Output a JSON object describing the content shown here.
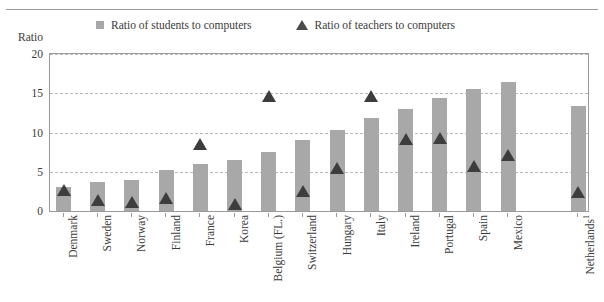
{
  "page": {
    "clipped_header_ghost": "",
    "axis_title": "Ratio"
  },
  "legend": {
    "items": [
      {
        "label": "Ratio of students to computers",
        "marker": "square-swatch",
        "color": "#a8a8a8"
      },
      {
        "label": "Ratio of teachers to computers",
        "marker": "triangle-swatch",
        "color": "#3d3d3d"
      }
    ]
  },
  "chart_data": {
    "type": "bar",
    "title": "",
    "xlabel": "",
    "ylabel": "Ratio",
    "ylim": [
      0,
      20
    ],
    "yticks": [
      0,
      5,
      10,
      15,
      20
    ],
    "grid": true,
    "legend_position": "top",
    "categories": [
      "Denmark",
      "Sweden",
      "Norway",
      "Finland",
      "France",
      "Korea",
      "Belgium (FL.)",
      "Switzerland",
      "Hungary",
      "Italy",
      "Ireland",
      "Portugal",
      "Spain",
      "Mexico",
      "Netherlands"
    ],
    "category_notes": {
      "Netherlands": "1"
    },
    "series": [
      {
        "name": "Ratio of students to computers",
        "type": "bar",
        "color": "#a8a8a8",
        "values": [
          3.1,
          3.7,
          3.9,
          5.2,
          6.0,
          6.5,
          7.5,
          9.1,
          10.3,
          11.8,
          13.0,
          14.4,
          15.5,
          16.4,
          13.4
        ]
      },
      {
        "name": "Ratio of teachers to computers",
        "type": "scatter",
        "marker": "triangle",
        "color": "#3d3d3d",
        "values": [
          2.7,
          1.4,
          1.2,
          1.7,
          8.5,
          0.9,
          14.7,
          2.5,
          5.5,
          14.6,
          9.2,
          9.3,
          5.7,
          7.1,
          2.4
        ]
      }
    ]
  }
}
